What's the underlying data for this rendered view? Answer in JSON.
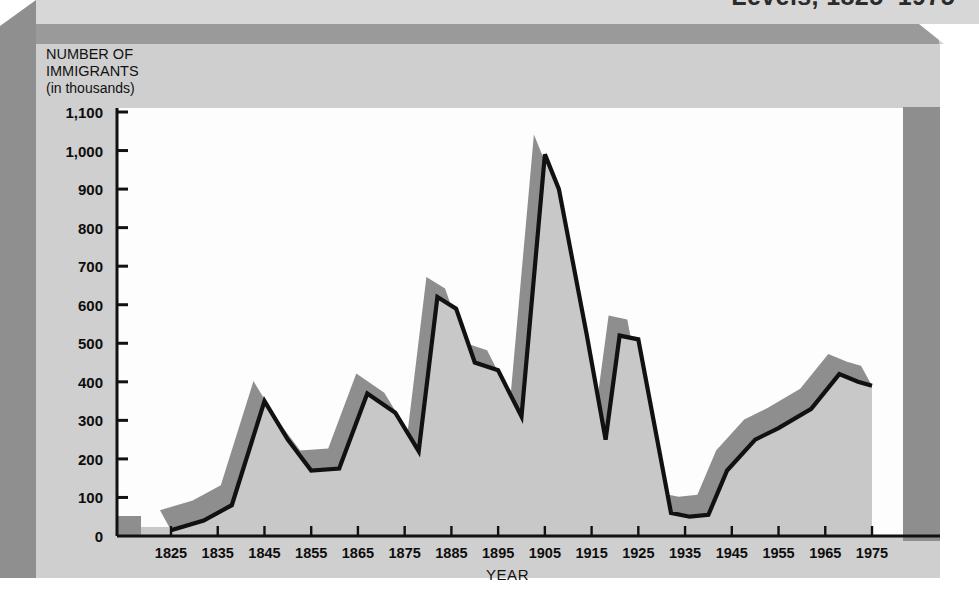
{
  "title": "Levels, 1825–1975",
  "axis": {
    "y_title_line1": "NUMBER OF",
    "y_title_line2": "IMMIGRANTS",
    "y_title_line3": "(in thousands)",
    "x_title": "YEAR"
  },
  "colors": {
    "card": "#cfcfcf",
    "bevel_dark": "#9a9a9a",
    "bevel_left": "#8f8f8f",
    "plot_background": "#fdfdfd",
    "line": "#111111",
    "fill": "#c8c8c8",
    "band": "#8e8e8e",
    "text": "#0d0d0d"
  },
  "chart_data": {
    "type": "area",
    "title": "Levels, 1825–1975",
    "xlabel": "YEAR",
    "ylabel": "NUMBER OF IMMIGRANTS (in thousands)",
    "xlim": [
      1820,
      1978
    ],
    "ylim": [
      0,
      1100
    ],
    "yticks": [
      "0",
      "100",
      "200",
      "300",
      "400",
      "500",
      "600",
      "700",
      "800",
      "900",
      "1,000",
      "1,100"
    ],
    "ytick_values": [
      0,
      100,
      200,
      300,
      400,
      500,
      600,
      700,
      800,
      900,
      1000,
      1100
    ],
    "xticks": [
      "1825",
      "1835",
      "1845",
      "1855",
      "1865",
      "1875",
      "1885",
      "1895",
      "1905",
      "1915",
      "1925",
      "1935",
      "1945",
      "1955",
      "1965",
      "1975"
    ],
    "xtick_values": [
      1825,
      1835,
      1845,
      1855,
      1865,
      1875,
      1885,
      1895,
      1905,
      1915,
      1925,
      1935,
      1945,
      1955,
      1965,
      1975
    ],
    "grid": false,
    "legend": null,
    "series": [
      {
        "name": "Number of immigrants (in thousands)",
        "x": [
          1825,
          1832,
          1838,
          1845,
          1850,
          1855,
          1861,
          1867,
          1873,
          1878,
          1882,
          1886,
          1890,
          1895,
          1900,
          1905,
          1908,
          1914,
          1918,
          1921,
          1925,
          1932,
          1936,
          1940,
          1944,
          1950,
          1955,
          1962,
          1968,
          1972,
          1975
        ],
        "y": [
          15,
          40,
          80,
          350,
          250,
          170,
          175,
          370,
          320,
          220,
          620,
          590,
          450,
          430,
          310,
          990,
          900,
          520,
          250,
          520,
          510,
          60,
          50,
          55,
          170,
          250,
          280,
          330,
          420,
          400,
          390
        ]
      }
    ]
  }
}
